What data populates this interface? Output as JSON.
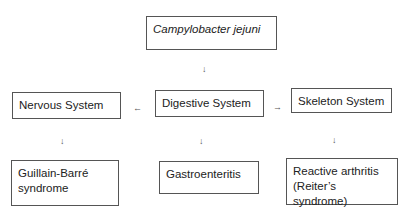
{
  "diagram": {
    "root": {
      "label": "Campylobacter jejuni"
    },
    "systems": [
      {
        "label": "Nervous System"
      },
      {
        "label": "Digestive System"
      },
      {
        "label": "Skeleton System"
      }
    ],
    "outcomes": [
      {
        "label": "Guillain-Barré syndrome",
        "line1": "Guillain-Barré",
        "line2": "syndrome"
      },
      {
        "label": "Gastroenteritis"
      },
      {
        "label": "Reactive arthritis (Reiter’s syndrome)",
        "line1": "Reactive arthritis",
        "line2": "(Reiter’s syndrome)"
      }
    ],
    "arrows": {
      "down": "↓",
      "left": "←",
      "right": "→"
    }
  }
}
